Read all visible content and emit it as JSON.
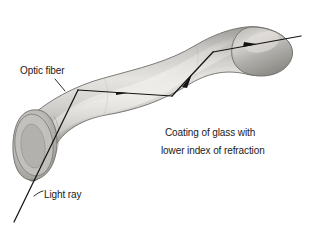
{
  "figure": {
    "background_color": "#ffffff",
    "width": 309,
    "height": 230
  },
  "labels": {
    "optic_fiber": "Optic fiber",
    "light_ray": "Light ray",
    "coating_line_1": "Coating of glass with",
    "coating_line_2": "lower index of refraction"
  },
  "colors": {
    "ray": "#141414",
    "text": "#1a1a1a",
    "fiber_light": "#d8d6d2",
    "fiber_mid": "#b4b2ae",
    "fiber_dark": "#8a8883",
    "fiber_edge": "#6f6d69",
    "fiber_highlight": "#e9e7e3"
  },
  "ray_path": {
    "description": "Light ray entering lower-left end face, reflecting off fiber walls, exiting upper-right tip",
    "points": [
      {
        "x": 14,
        "y": 222,
        "name": "entry-start"
      },
      {
        "x": 78,
        "y": 90,
        "name": "reflection-1"
      },
      {
        "x": 172,
        "y": 96,
        "name": "reflection-2"
      },
      {
        "x": 213,
        "y": 52,
        "name": "reflection-3"
      },
      {
        "x": 301,
        "y": 36,
        "name": "exit-end"
      }
    ],
    "arrowheads": [
      {
        "x": 125,
        "y": 93,
        "name": "arrowhead-segment-2"
      },
      {
        "x": 190,
        "y": 77,
        "name": "arrowhead-segment-3"
      },
      {
        "x": 255,
        "y": 44,
        "name": "arrowhead-segment-4"
      }
    ]
  },
  "leaders": [
    {
      "name": "optic-fiber-leader",
      "from": {
        "x": 55,
        "y": 79
      },
      "to": {
        "x": 64,
        "y": 90
      }
    },
    {
      "name": "light-ray-leader",
      "from": {
        "x": 43,
        "y": 191
      },
      "to": {
        "x": 34,
        "y": 196
      }
    }
  ]
}
